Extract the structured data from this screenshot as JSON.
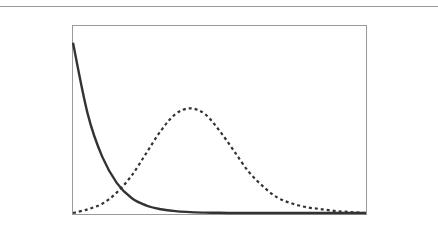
{
  "chart_data": {
    "type": "line",
    "title": "",
    "xlabel": "",
    "ylabel": "",
    "grid": false,
    "legend": null,
    "x": [
      0,
      0.05,
      0.1,
      0.15,
      0.2,
      0.25,
      0.3,
      0.35,
      0.4,
      0.45,
      0.5,
      0.55,
      0.6,
      0.65,
      0.7,
      0.75,
      0.8,
      0.85,
      0.9,
      0.95,
      1.0
    ],
    "xlim": [
      0,
      1
    ],
    "ylim": [
      0,
      1
    ],
    "series": [
      {
        "name": "solid-decay",
        "style": "solid",
        "color": "#333333",
        "values": [
          0.91,
          0.53,
          0.3,
          0.16,
          0.08,
          0.04,
          0.02,
          0.01,
          0.005,
          0.002,
          0.001,
          0,
          0,
          0,
          0,
          0,
          0,
          0,
          0,
          0,
          0
        ]
      },
      {
        "name": "dashed-gaussian",
        "style": "dashed",
        "color": "#333333",
        "values": [
          0.0,
          0.02,
          0.05,
          0.11,
          0.2,
          0.32,
          0.44,
          0.53,
          0.56,
          0.53,
          0.44,
          0.33,
          0.22,
          0.14,
          0.08,
          0.05,
          0.03,
          0.02,
          0.01,
          0.005,
          0.0
        ]
      }
    ],
    "plot_box": {
      "left": 72,
      "top": 25,
      "right": 366,
      "bottom": 214
    }
  }
}
